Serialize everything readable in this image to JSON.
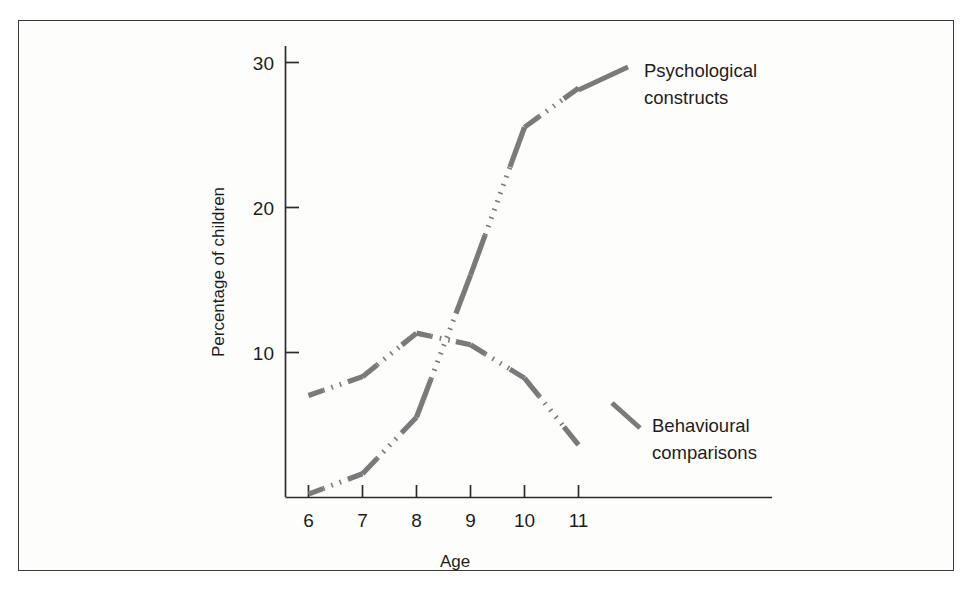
{
  "figure": {
    "background_color": "#fdfdfc",
    "frame_color": "#3a3a3a",
    "line_color": "#7a7a7a",
    "axis_color": "#2b2b2b"
  },
  "chart_data": {
    "type": "line",
    "title": "",
    "subtitle": "",
    "xlabel": "Age",
    "ylabel": "Percentage of children",
    "x": [
      6,
      7,
      8,
      9,
      10,
      11
    ],
    "xticklabels": [
      "6",
      "7",
      "8",
      "9",
      "10",
      "11"
    ],
    "yticklabels": [
      "10",
      "20",
      "30"
    ],
    "yticks": [
      10,
      20,
      30
    ],
    "xlim": [
      5.6,
      12.2
    ],
    "ylim": [
      0,
      32
    ],
    "grid": false,
    "legend_position": "inline-annotation",
    "line_style": "solid-stubs-with-dotted-connectors",
    "series": [
      {
        "name": "Psychological constructs",
        "label_line1": "Psychological",
        "label_line2": "constructs",
        "color": "#7a7a7a",
        "values": [
          0.2,
          1.6,
          5.5,
          15.3,
          25.5,
          28.2
        ]
      },
      {
        "name": "Behavioural comparisons",
        "label_line1": "Behavioural",
        "label_line2": "comparisons",
        "color": "#7a7a7a",
        "values": [
          7.0,
          8.3,
          11.3,
          10.5,
          8.2,
          3.6
        ]
      }
    ],
    "annotations": [
      {
        "text": "Psychological constructs",
        "target_series": "Psychological constructs",
        "at_x": 11
      },
      {
        "text": "Behavioural comparisons",
        "target_series": "Behavioural comparisons",
        "at_x": 11
      }
    ]
  }
}
